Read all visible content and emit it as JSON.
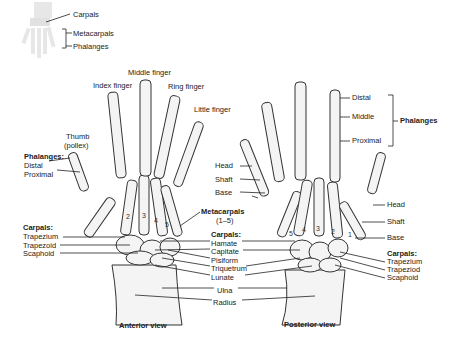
{
  "inset": {
    "labels": [
      "Carpals",
      "Metacarpals",
      "Phalanges"
    ]
  },
  "anterior": {
    "title": "Anterior view",
    "fingers": {
      "index": "Index finger",
      "middle": "Middle finger",
      "ring": "Ring finger",
      "little": "Little finger",
      "thumb": "Thumb",
      "thumb_alt": "(pollex)"
    },
    "phalanges_heading": "Phalanges:",
    "phalanges": [
      "Distal",
      "Proximal"
    ],
    "carpals_heading": "Carpals:",
    "carpals_left": [
      "Trapezium",
      "Trapezoid",
      "Scaphoid"
    ],
    "metacarpal_numbers": [
      "2",
      "3",
      "4",
      "5"
    ]
  },
  "center": {
    "metacarpals_heading": "Metacarpals",
    "metacarpals_range": "(1–5)",
    "carpals_heading": "Carpals:",
    "carpals": [
      "Hamate",
      "Capitate",
      "Pisiform",
      "Triquetrum",
      "Lunate"
    ],
    "forearm": [
      "Ulna",
      "Radius"
    ]
  },
  "posterior": {
    "title": "Posterior view",
    "phalanges_heading": "Phalanges",
    "phalanges": [
      "Distal",
      "Middle",
      "Proximal"
    ],
    "metacarpal_parts_left": [
      "Head",
      "Shaft",
      "Base"
    ],
    "metacarpal_parts_right": [
      "Head",
      "Shaft",
      "Base"
    ],
    "carpals_heading": "Carpals:",
    "carpals_right": [
      "Trapezium",
      "Trapeziod",
      "Scaphoid"
    ],
    "metacarpal_numbers": [
      "5",
      "4",
      "3",
      "2",
      "1"
    ]
  }
}
